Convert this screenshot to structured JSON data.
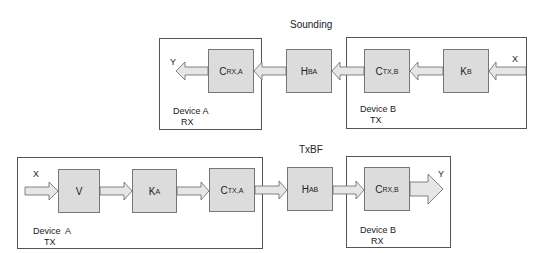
{
  "sounding": {
    "title": "Sounding",
    "device_a": {
      "name": "Device A",
      "role": "RX"
    },
    "device_b": {
      "name": "Device B",
      "role": "TX"
    },
    "input_label": "X",
    "output_label": "Y",
    "blocks": [
      {
        "id": "c_rx_a",
        "main": "C",
        "sub": "RX,A"
      },
      {
        "id": "h_ba",
        "main": "H",
        "sub": "BA"
      },
      {
        "id": "c_tx_b",
        "main": "C",
        "sub": "TX,B"
      },
      {
        "id": "k_b",
        "main": "K",
        "sub": "B"
      }
    ],
    "flow": "X → K_B → C_TX,B → H_BA → C_RX,A → Y (right to left)"
  },
  "txbf": {
    "title": "TxBF",
    "device_a": {
      "name": "Device  A",
      "role": "TX"
    },
    "device_b": {
      "name": "Device B",
      "role": "RX"
    },
    "input_label": "X",
    "output_label": "Y",
    "blocks": [
      {
        "id": "v",
        "main": "V",
        "sub": ""
      },
      {
        "id": "k_a",
        "main": "K",
        "sub": "A"
      },
      {
        "id": "c_tx_a",
        "main": "C",
        "sub": "TX,A"
      },
      {
        "id": "h_ab",
        "main": "H",
        "sub": "AB"
      },
      {
        "id": "c_rx_b",
        "main": "C",
        "sub": "RX,B"
      }
    ],
    "flow": "X → V → K_A → C_TX,A → H_AB → C_RX,B → Y (left to right)"
  },
  "colors": {
    "block_fill": "#dcdcdc",
    "arrow_fill": "#e6e6e6",
    "stroke": "#666666"
  }
}
